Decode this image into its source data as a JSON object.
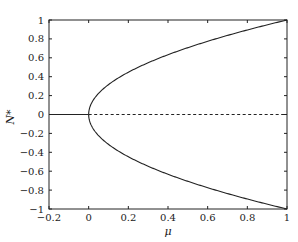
{
  "chart_data": {
    "type": "line",
    "title": "",
    "xlabel": "μ",
    "ylabel": "N*",
    "xlim": [
      -0.2,
      1
    ],
    "ylim": [
      -1,
      1
    ],
    "grid": false,
    "legend": null,
    "xticks": [
      -0.2,
      0,
      0.2,
      0.4,
      0.6,
      0.8,
      1
    ],
    "xtick_labels": [
      "−0.2",
      "0",
      "0.2",
      "0.4",
      "0.6",
      "0.8",
      "1"
    ],
    "yticks": [
      -1,
      -0.8,
      -0.6,
      -0.4,
      -0.2,
      0,
      0.2,
      0.4,
      0.6,
      0.8,
      1
    ],
    "ytick_labels": [
      "−1",
      "−0.8",
      "−0.6",
      "−0.4",
      "−0.2",
      "0",
      "0.2",
      "0.4",
      "0.6",
      "0.8",
      "1"
    ],
    "series": [
      {
        "name": "stable trivial branch",
        "style": "solid",
        "x": [
          -0.2,
          0
        ],
        "y": [
          0,
          0
        ]
      },
      {
        "name": "unstable trivial branch",
        "style": "dashed",
        "x": [
          0,
          1
        ],
        "y": [
          0,
          0
        ]
      },
      {
        "name": "upper branch N* = sqrt(mu)",
        "style": "solid",
        "x": [
          0,
          0.01,
          0.05,
          0.1,
          0.2,
          0.3,
          0.4,
          0.5,
          0.6,
          0.7,
          0.8,
          0.9,
          1.0
        ],
        "y": [
          0,
          0.1,
          0.224,
          0.316,
          0.447,
          0.548,
          0.632,
          0.707,
          0.775,
          0.837,
          0.894,
          0.949,
          1.0
        ]
      },
      {
        "name": "lower branch N* = -sqrt(mu)",
        "style": "solid",
        "x": [
          0,
          0.01,
          0.05,
          0.1,
          0.2,
          0.3,
          0.4,
          0.5,
          0.6,
          0.7,
          0.8,
          0.9,
          1.0
        ],
        "y": [
          0,
          -0.1,
          -0.224,
          -0.316,
          -0.447,
          -0.548,
          -0.632,
          -0.707,
          -0.775,
          -0.837,
          -0.894,
          -0.949,
          -1.0
        ]
      }
    ]
  }
}
